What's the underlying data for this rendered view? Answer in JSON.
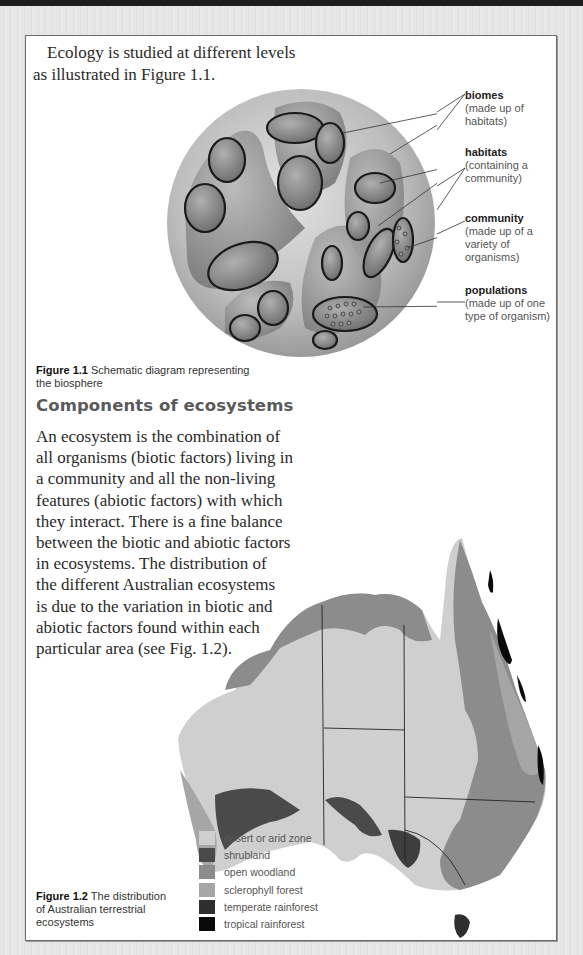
{
  "intro_text": {
    "line1": "Ecology is studied at different levels",
    "line2": "as illustrated in Figure 1.1."
  },
  "figure1": {
    "caption_label": "Figure 1.1",
    "caption_text_line1": "Schematic diagram representing",
    "caption_text_line2": "the biosphere",
    "labels": [
      {
        "term": "biomes",
        "desc": [
          "(made up of",
          "habitats)"
        ]
      },
      {
        "term": "habitats",
        "desc": [
          "(containing a",
          "community)"
        ]
      },
      {
        "term": "community",
        "desc": [
          "(made up of a",
          "variety of",
          "organisms)"
        ]
      },
      {
        "term": "populations",
        "desc": [
          "(made up of one",
          "type of organism)"
        ]
      }
    ]
  },
  "section": {
    "heading": "Components of ecosystems",
    "lines": [
      "An ecosystem is the combination of",
      "all organisms (biotic factors) living in",
      "a community and all the non-living",
      "features (abiotic factors) with which",
      "they interact. There is a fine balance",
      "between the biotic and abiotic factors",
      "in ecosystems. The distribution of",
      "the different Australian ecosystems",
      "is due to the variation in biotic and",
      "abiotic factors found within each",
      "particular area (see Fig. 1.2)."
    ]
  },
  "figure2": {
    "caption_label": "Figure 1.2",
    "caption_text_line1": "The distribution",
    "caption_text_line2": "of Australian terrestrial",
    "caption_text_line3": "ecosystems",
    "legend": [
      {
        "label": "desert or arid zone",
        "color": "#cfcfcf"
      },
      {
        "label": "shrubland",
        "color": "#4a4a4a"
      },
      {
        "label": "open woodland",
        "color": "#8c8c8c"
      },
      {
        "label": "sclerophyll forest",
        "color": "#a6a6a6"
      },
      {
        "label": "temperate rainforest",
        "color": "#2e2e2e"
      },
      {
        "label": "tropical rainforest",
        "color": "#0a0a0a"
      }
    ]
  }
}
